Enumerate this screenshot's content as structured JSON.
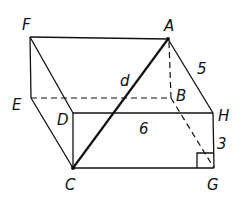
{
  "diagram": {
    "title": "",
    "vertices": {
      "F": {
        "label": "F"
      },
      "A": {
        "label": "A"
      },
      "E": {
        "label": "E"
      },
      "B": {
        "label": "B"
      },
      "D": {
        "label": "D"
      },
      "H": {
        "label": "H"
      },
      "C": {
        "label": "C"
      },
      "G": {
        "label": "G"
      }
    },
    "measures": {
      "AH": "5",
      "DH": "6",
      "HG": "3",
      "AC": "d"
    },
    "right_angle_at": "G"
  }
}
